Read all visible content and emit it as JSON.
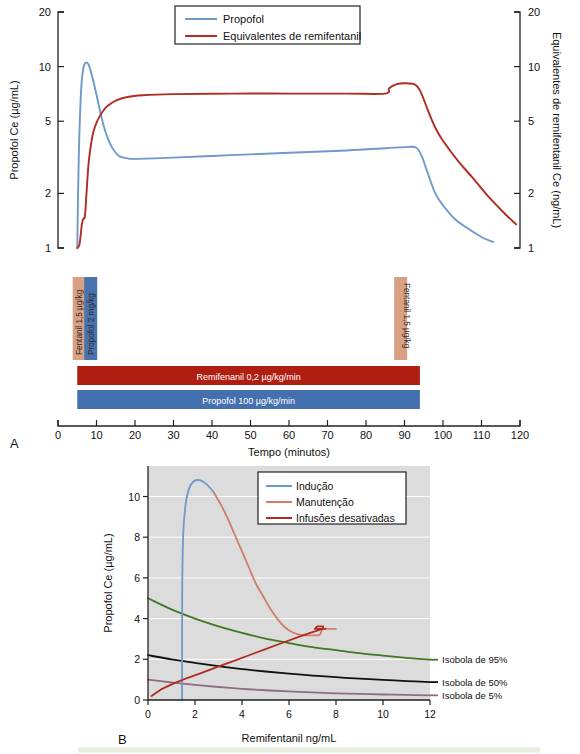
{
  "figure": {
    "panel_a_label": "A",
    "panel_b_label": "B"
  },
  "chart_data": [
    {
      "type": "line",
      "panel": "A",
      "title": "",
      "xlabel": "Tempo (minutos)",
      "ylabel": "Propofol Ce (µg/mL)",
      "ylabel_right": "Equivalentes de remifentanil Ce (ng/mL)",
      "xlim": [
        0,
        120
      ],
      "xticks": [
        0,
        10,
        20,
        30,
        40,
        50,
        60,
        70,
        80,
        90,
        100,
        110,
        120
      ],
      "yscale": "log",
      "ylim": [
        1,
        20
      ],
      "yticks": [
        1,
        2,
        5,
        10,
        20
      ],
      "yticks_right": [
        1,
        2,
        5,
        10,
        20
      ],
      "grid": false,
      "legend_position": "top-center",
      "legend": [
        "Propofol",
        "Equivalentes de remifentanil"
      ],
      "series": [
        {
          "name": "Propofol",
          "color": "#6e99c8",
          "x": [
            5,
            5.4,
            6,
            6.6,
            7.2,
            8,
            9,
            10,
            11,
            12,
            13,
            14,
            15,
            16,
            18,
            20,
            30,
            45,
            60,
            75,
            85,
            90,
            93,
            94.5,
            96,
            98,
            100,
            103,
            106,
            110,
            113
          ],
          "y": [
            1.0,
            3.2,
            7.4,
            9.8,
            10.5,
            10.2,
            8.6,
            7.0,
            5.6,
            4.6,
            4.0,
            3.6,
            3.35,
            3.2,
            3.12,
            3.1,
            3.15,
            3.25,
            3.35,
            3.45,
            3.55,
            3.6,
            3.58,
            3.2,
            2.6,
            2.0,
            1.72,
            1.45,
            1.3,
            1.15,
            1.08
          ]
        },
        {
          "name": "Equivalentes de remifentanil",
          "color": "#b02c24",
          "x": [
            5,
            5.6,
            6.2,
            6.6,
            7.0,
            7.4,
            8,
            9,
            10,
            11,
            12,
            13,
            15,
            18,
            22,
            30,
            45,
            60,
            75,
            85,
            86,
            88,
            90,
            92,
            93,
            94,
            95,
            96,
            98,
            100,
            104,
            108,
            112,
            116,
            119
          ],
          "y": [
            1.0,
            1.05,
            1.35,
            1.45,
            1.5,
            2.0,
            3.0,
            4.2,
            4.9,
            5.4,
            5.8,
            6.1,
            6.5,
            6.8,
            6.95,
            7.05,
            7.1,
            7.1,
            7.1,
            7.1,
            7.6,
            8.0,
            8.1,
            8.05,
            7.9,
            7.4,
            6.6,
            5.8,
            4.6,
            3.9,
            3.0,
            2.4,
            1.9,
            1.55,
            1.35
          ]
        }
      ],
      "bolus_markers": [
        {
          "label": "Fentanil 1,5 µg/kg",
          "time": 5.5,
          "color": "#d9a183"
        },
        {
          "label": "Propofol 2 mg/kg",
          "time": 8.5,
          "color": "#4a72ae"
        },
        {
          "label": "Fentanil 1,5 µg/kg",
          "time": 89,
          "color": "#d9a183"
        }
      ],
      "infusion_bars": [
        {
          "label": "Remifenanil 0,2 µg/kg/min",
          "start": 5,
          "end": 94,
          "color": "#b01e11"
        },
        {
          "label": "Propofol 100 µg/kg/min",
          "start": 5,
          "end": 94,
          "color": "#4470b0"
        }
      ]
    },
    {
      "type": "line",
      "panel": "B",
      "title": "",
      "xlabel": "Remifentanil ng/mL",
      "ylabel": "Propofol Ce (µg/mL)",
      "xlim": [
        0,
        12
      ],
      "xticks": [
        0,
        2,
        4,
        6,
        8,
        10,
        12
      ],
      "ylim": [
        0,
        11.5
      ],
      "yticks": [
        0,
        2,
        4,
        6,
        8,
        10
      ],
      "grid": true,
      "grid_color": "#ffffff",
      "plot_background": "#dcdcdc",
      "legend_position": "top-right",
      "legend": [
        "Indução",
        "Manutenção",
        "Infusões desativadas"
      ],
      "series": [
        {
          "name": "Indução",
          "color": "#6e99c8",
          "x": [
            1.45,
            1.45,
            1.46,
            1.5,
            1.6,
            1.75,
            1.95,
            2.2,
            2.5,
            2.8
          ],
          "y": [
            0.0,
            3.5,
            6.0,
            8.2,
            9.6,
            10.4,
            10.75,
            10.8,
            10.6,
            10.2
          ]
        },
        {
          "name": "Manutenção",
          "color": "#cf7e68",
          "x": [
            2.8,
            3.1,
            3.4,
            3.7,
            4.0,
            4.3,
            4.6,
            4.9,
            5.2,
            5.5,
            5.8,
            6.1,
            6.4,
            6.7,
            7.0,
            7.3,
            7.4,
            7.5,
            7.6,
            8.0
          ],
          "y": [
            10.2,
            9.6,
            8.9,
            8.1,
            7.3,
            6.5,
            5.7,
            5.1,
            4.5,
            4.0,
            3.6,
            3.35,
            3.22,
            3.18,
            3.18,
            3.2,
            3.45,
            3.5,
            3.5,
            3.5
          ]
        },
        {
          "name": "Infusões desativadas",
          "color": "#b02c24",
          "x": [
            0.15,
            0.6,
            1.1,
            1.6,
            2.2,
            2.9,
            3.6,
            4.3,
            5.0,
            5.7,
            6.3,
            6.9,
            7.3,
            7.45,
            7.45,
            7.2,
            7.1,
            7.55
          ],
          "y": [
            0.2,
            0.55,
            0.82,
            1.05,
            1.3,
            1.6,
            1.9,
            2.2,
            2.5,
            2.8,
            3.05,
            3.3,
            3.45,
            3.5,
            3.62,
            3.62,
            3.5,
            3.5
          ]
        }
      ],
      "isoboles": [
        {
          "label": "Isobola de 95%",
          "color": "#3f7a22",
          "x": [
            0,
            1,
            2,
            3,
            4,
            5,
            6,
            7,
            8,
            9,
            10,
            11,
            12
          ],
          "y": [
            5.0,
            4.45,
            4.0,
            3.62,
            3.3,
            3.02,
            2.8,
            2.6,
            2.45,
            2.3,
            2.18,
            2.07,
            1.98
          ]
        },
        {
          "label": "Isobola de 50%",
          "color": "#111111",
          "x": [
            0,
            1,
            2,
            3,
            4,
            5,
            6,
            7,
            8,
            9,
            10,
            11,
            12
          ],
          "y": [
            2.2,
            2.0,
            1.82,
            1.66,
            1.52,
            1.4,
            1.3,
            1.2,
            1.12,
            1.05,
            0.99,
            0.93,
            0.88
          ]
        },
        {
          "label": "Isobola de 5%",
          "color": "#8d6e84",
          "x": [
            0,
            1,
            2,
            3,
            4,
            5,
            6,
            7,
            8,
            9,
            10,
            11,
            12
          ],
          "y": [
            1.0,
            0.86,
            0.74,
            0.64,
            0.55,
            0.48,
            0.42,
            0.37,
            0.33,
            0.3,
            0.27,
            0.25,
            0.23
          ]
        }
      ]
    }
  ]
}
